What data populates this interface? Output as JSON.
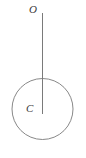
{
  "figure": {
    "type": "geometry-diagram",
    "canvas": {
      "width": 86,
      "height": 158,
      "background": "#ffffff"
    },
    "stroke_color": "#7a7a7a",
    "label_color": "#3a3a3a",
    "circle": {
      "name": "circle",
      "center_x": 42.5,
      "center_y": 109,
      "radius": 30.5,
      "stroke_width": 0.9,
      "fill": "none"
    },
    "segment": {
      "name": "segment-oc",
      "x1": 42.5,
      "y1": 13,
      "x2": 42.5,
      "y2": 114,
      "stroke_width": 1
    },
    "labels": [
      {
        "id": "o",
        "text": "O",
        "x": 33,
        "y": 10,
        "style": "italic"
      },
      {
        "id": "c",
        "text": "C",
        "x": 30,
        "y": 109,
        "style": "italic"
      }
    ]
  }
}
